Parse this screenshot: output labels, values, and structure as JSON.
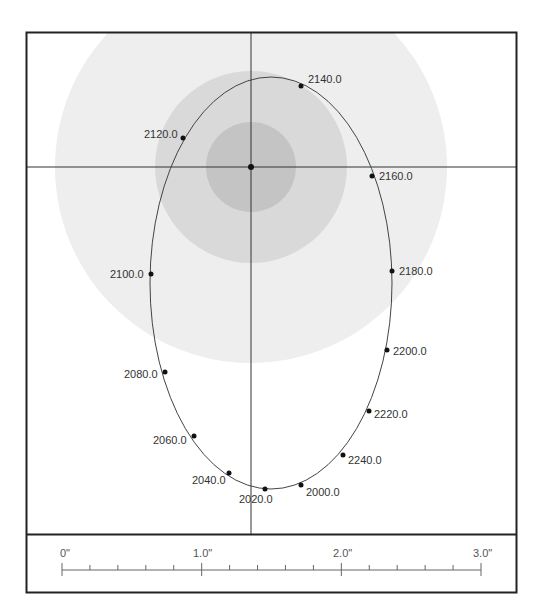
{
  "diagram": {
    "type": "orbit-plot",
    "frame": {
      "border_color": "#222222"
    },
    "disks": {
      "outer_color": "#eeeeee",
      "middle_color": "#d9d9d9",
      "inner_color": "#c4c4c4"
    },
    "crosshair_color": "#333333",
    "orbit_color": "#444444",
    "epoch_points": [
      {
        "label": "2000.0",
        "x": 301,
        "y": 485,
        "lx": 306,
        "ly": 496,
        "anchor": "start"
      },
      {
        "label": "2020.0",
        "x": 265,
        "y": 489,
        "lx": 239,
        "ly": 503,
        "anchor": "start"
      },
      {
        "label": "2040.0",
        "x": 229,
        "y": 473,
        "lx": 192,
        "ly": 484,
        "anchor": "start"
      },
      {
        "label": "2060.0",
        "x": 194,
        "y": 436,
        "lx": 153,
        "ly": 444,
        "anchor": "start"
      },
      {
        "label": "2080.0",
        "x": 165,
        "y": 372,
        "lx": 124,
        "ly": 378,
        "anchor": "start"
      },
      {
        "label": "2100.0",
        "x": 151,
        "y": 274,
        "lx": 110,
        "ly": 278,
        "anchor": "start"
      },
      {
        "label": "2120.0",
        "x": 183,
        "y": 138,
        "lx": 144,
        "ly": 138,
        "anchor": "start"
      },
      {
        "label": "2140.0",
        "x": 301,
        "y": 86,
        "lx": 308,
        "ly": 83,
        "anchor": "start"
      },
      {
        "label": "2160.0",
        "x": 372,
        "y": 176,
        "lx": 379,
        "ly": 180,
        "anchor": "start"
      },
      {
        "label": "2180.0",
        "x": 392,
        "y": 271,
        "lx": 399,
        "ly": 275,
        "anchor": "start"
      },
      {
        "label": "2200.0",
        "x": 387,
        "y": 350,
        "lx": 393,
        "ly": 355,
        "anchor": "start"
      },
      {
        "label": "2220.0",
        "x": 369,
        "y": 411,
        "lx": 374,
        "ly": 418,
        "anchor": "start"
      },
      {
        "label": "2240.0",
        "x": 343,
        "y": 455,
        "lx": 348,
        "ly": 464,
        "anchor": "start"
      }
    ],
    "scale_bar": {
      "labels": [
        {
          "text": "0\"",
          "x": 60
        },
        {
          "text": "1.0\"",
          "x": 193
        },
        {
          "text": "2.0\"",
          "x": 333
        },
        {
          "text": "3.0\"",
          "x": 473
        }
      ],
      "unit": "arcsec",
      "max": 3.0
    }
  }
}
